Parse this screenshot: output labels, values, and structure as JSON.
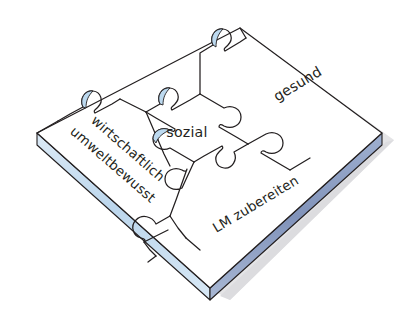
{
  "diagram": {
    "type": "jigsaw-puzzle-isometric",
    "board": {
      "name": "puzzle-board",
      "top_face_color": "#ffffff",
      "left_edge_color": "#c7dcee",
      "right_edge_color": "#8d9ec3",
      "outline_color": "#231f20",
      "shadow_color": "#e2e2e4"
    },
    "pieces": [
      {
        "id": "sozial",
        "label": "sozial",
        "position": "center",
        "rotation_deg": 0,
        "fill": "#ffffff"
      },
      {
        "id": "gesund",
        "label": "gesund",
        "position": "upper-right",
        "rotation_deg": -30,
        "fill": "#ffffff"
      },
      {
        "id": "wirtschaftlich-umweltbewusst",
        "label_line_1": "wirtschaftlich",
        "label_line_2": "umweltbewusst",
        "position": "left",
        "rotation_deg": 30,
        "fill": "#ffffff"
      },
      {
        "id": "lm-zubereiten",
        "label": "LM zubereiten",
        "position": "lower-right",
        "rotation_deg": -30,
        "fill": "#ffffff"
      }
    ],
    "notch_accents": [
      {
        "id": "notch-top",
        "color": "#bcd9ef"
      },
      {
        "id": "notch-center-left",
        "color": "#bcd9ef"
      },
      {
        "id": "notch-left-piece",
        "color": "#bcd9ef"
      }
    ]
  }
}
